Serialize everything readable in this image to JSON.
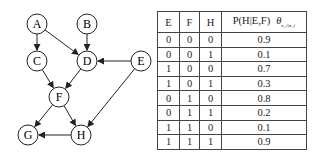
{
  "graph": {
    "nodes": [
      {
        "id": "A",
        "label": "A",
        "x": 37,
        "y": 24
      },
      {
        "id": "B",
        "label": "B",
        "x": 87,
        "y": 24
      },
      {
        "id": "C",
        "label": "C",
        "x": 37,
        "y": 61
      },
      {
        "id": "D",
        "label": "D",
        "x": 87,
        "y": 61
      },
      {
        "id": "E",
        "label": "E",
        "x": 141,
        "y": 61
      },
      {
        "id": "F",
        "label": "F",
        "x": 59,
        "y": 97
      },
      {
        "id": "G",
        "label": "G",
        "x": 28,
        "y": 135
      },
      {
        "id": "H",
        "label": "H",
        "x": 81,
        "y": 135
      }
    ],
    "edges": [
      [
        "A",
        "C"
      ],
      [
        "A",
        "D"
      ],
      [
        "B",
        "D"
      ],
      [
        "E",
        "D"
      ],
      [
        "C",
        "F"
      ],
      [
        "D",
        "F"
      ],
      [
        "E",
        "H"
      ],
      [
        "F",
        "G"
      ],
      [
        "F",
        "H"
      ],
      [
        "H",
        "G"
      ]
    ]
  },
  "table": {
    "headers": [
      "E",
      "F",
      "H",
      "P(H|E,F)"
    ],
    "theta": "θ",
    "theta_sub": "x_i|π_i",
    "rows": [
      [
        "0",
        "0",
        "0",
        "0.9"
      ],
      [
        "0",
        "0",
        "1",
        "0.1"
      ],
      [
        "1",
        "0",
        "0",
        "0.7"
      ],
      [
        "1",
        "0",
        "1",
        "0.3"
      ],
      [
        "0",
        "1",
        "0",
        "0.8"
      ],
      [
        "0",
        "1",
        "1",
        "0.2"
      ],
      [
        "1",
        "1",
        "0",
        "0.1"
      ],
      [
        "1",
        "1",
        "1",
        "0.9"
      ]
    ]
  }
}
